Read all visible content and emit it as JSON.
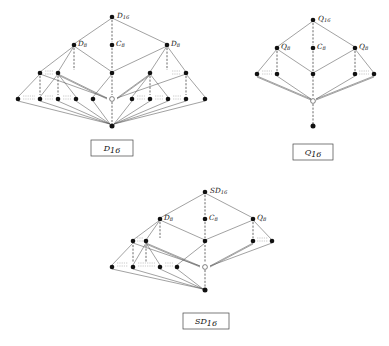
{
  "figure": {
    "type": "hasse-diagram-set",
    "background": "#ffffff",
    "ink": "#111111",
    "edge_color": "#555555",
    "count": 3
  },
  "diagrams": [
    {
      "id": "D16",
      "caption": "D16",
      "caption_text": "D",
      "caption_sub": "16",
      "top": {
        "text": "D",
        "sub": "16"
      },
      "level2": [
        {
          "text": "D",
          "sub": "8"
        },
        {
          "text": "C",
          "sub": "8"
        },
        {
          "text": "D",
          "sub": "8"
        }
      ],
      "rows": [
        {
          "name": "top",
          "filled": 1,
          "open": 0
        },
        {
          "name": "second",
          "filled": 3,
          "open": 0
        },
        {
          "name": "third",
          "filled": 5,
          "open": 0
        },
        {
          "name": "fourth",
          "filled": 8,
          "open": 1
        },
        {
          "name": "bottom",
          "filled": 1,
          "open": 0
        }
      ],
      "ellipsis_groups": 6
    },
    {
      "id": "Q16",
      "caption": "Q16",
      "caption_text": "Q",
      "caption_sub": "16",
      "top": {
        "text": "Q",
        "sub": "16"
      },
      "level2": [
        {
          "text": "Q",
          "sub": "8"
        },
        {
          "text": "C",
          "sub": "8"
        },
        {
          "text": "Q",
          "sub": "8"
        }
      ],
      "rows": [
        {
          "name": "top",
          "filled": 1,
          "open": 0
        },
        {
          "name": "second",
          "filled": 3,
          "open": 0
        },
        {
          "name": "third",
          "filled": 5,
          "open": 0
        },
        {
          "name": "fourth",
          "filled": 0,
          "open": 1
        },
        {
          "name": "bottom",
          "filled": 1,
          "open": 0
        }
      ],
      "ellipsis_groups": 2
    },
    {
      "id": "SD16",
      "caption": "SD16",
      "caption_text": "SD",
      "caption_sub": "16",
      "top": {
        "text": "SD",
        "sub": "16"
      },
      "level2": [
        {
          "text": "D",
          "sub": "8"
        },
        {
          "text": "C",
          "sub": "8"
        },
        {
          "text": "Q",
          "sub": "8"
        }
      ],
      "rows": [
        {
          "name": "top",
          "filled": 1,
          "open": 0
        },
        {
          "name": "second",
          "filled": 3,
          "open": 0
        },
        {
          "name": "third",
          "filled": 5,
          "open": 0
        },
        {
          "name": "fourth",
          "filled": 4,
          "open": 1
        },
        {
          "name": "bottom",
          "filled": 1,
          "open": 0
        }
      ],
      "ellipsis_groups": 4
    }
  ],
  "labels": {
    "d16_top_main": "D",
    "d16_top_sub": "16",
    "d16_l_main": "D",
    "d16_l_sub": "8",
    "d16_c_main": "C",
    "d16_c_sub": "8",
    "d16_r_main": "D",
    "d16_r_sub": "8",
    "d16_cap_main": "D",
    "d16_cap_sub": "16",
    "q16_top_main": "Q",
    "q16_top_sub": "16",
    "q16_l_main": "Q",
    "q16_l_sub": "8",
    "q16_c_main": "C",
    "q16_c_sub": "8",
    "q16_r_main": "Q",
    "q16_r_sub": "8",
    "q16_cap_main": "Q",
    "q16_cap_sub": "16",
    "sd16_top_main": "SD",
    "sd16_top_sub": "16",
    "sd16_l_main": "D",
    "sd16_l_sub": "8",
    "sd16_c_main": "C",
    "sd16_c_sub": "8",
    "sd16_r_main": "Q",
    "sd16_r_sub": "8",
    "sd16_cap_main": "SD",
    "sd16_cap_sub": "16"
  }
}
